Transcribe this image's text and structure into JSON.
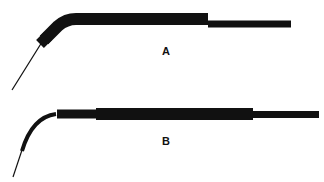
{
  "figure": {
    "instruments": [
      {
        "id": "A",
        "label": "A",
        "description": "electrode probe with angled tip and straight needle"
      },
      {
        "id": "B",
        "label": "B",
        "description": "electrode probe with gradually curved tip and needle"
      }
    ],
    "colors": {
      "ink": "#111111",
      "background": "#ffffff"
    }
  }
}
